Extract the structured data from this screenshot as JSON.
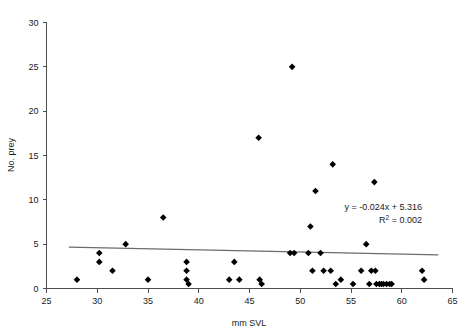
{
  "chart_data": {
    "type": "scatter",
    "title": "",
    "xlabel": "mm SVL",
    "ylabel": "No. prey",
    "xlim": [
      25,
      65
    ],
    "ylim": [
      0,
      30
    ],
    "xticks": [
      25,
      30,
      35,
      40,
      45,
      50,
      55,
      60,
      65
    ],
    "xtick_labels": [
      "25",
      "30",
      "35",
      "40",
      "45",
      "50",
      "55",
      "60",
      "65"
    ],
    "yticks": [
      0,
      5,
      10,
      15,
      20,
      25,
      30
    ],
    "ytick_labels": [
      "0",
      "5",
      "10",
      "15",
      "20",
      "25",
      "30"
    ],
    "grid": false,
    "legend": null,
    "marker": "diamond",
    "marker_color": "#000000",
    "points": [
      [
        28.0,
        1
      ],
      [
        30.2,
        4
      ],
      [
        30.2,
        3
      ],
      [
        31.5,
        2
      ],
      [
        32.8,
        5
      ],
      [
        35.0,
        1
      ],
      [
        36.5,
        8
      ],
      [
        38.8,
        3
      ],
      [
        38.8,
        2
      ],
      [
        38.8,
        1
      ],
      [
        39.0,
        0.5
      ],
      [
        43.0,
        1
      ],
      [
        43.5,
        3
      ],
      [
        44.0,
        1
      ],
      [
        45.9,
        17
      ],
      [
        46.0,
        1
      ],
      [
        46.2,
        0.5
      ],
      [
        49.2,
        25
      ],
      [
        49.0,
        4
      ],
      [
        49.4,
        4
      ],
      [
        50.8,
        4
      ],
      [
        51.0,
        7
      ],
      [
        51.2,
        2
      ],
      [
        51.5,
        11
      ],
      [
        52.0,
        4
      ],
      [
        52.3,
        2
      ],
      [
        53.0,
        2
      ],
      [
        53.2,
        14
      ],
      [
        53.5,
        0.5
      ],
      [
        54.0,
        1
      ],
      [
        55.2,
        0.5
      ],
      [
        56.0,
        2
      ],
      [
        56.5,
        5
      ],
      [
        56.8,
        0.5
      ],
      [
        57.0,
        2
      ],
      [
        57.3,
        12
      ],
      [
        57.4,
        2
      ],
      [
        57.5,
        0.5
      ],
      [
        57.8,
        0.5
      ],
      [
        58.0,
        0.5
      ],
      [
        58.2,
        0.5
      ],
      [
        58.5,
        0.5
      ],
      [
        58.8,
        0.5
      ],
      [
        59.0,
        0.5
      ],
      [
        62.0,
        2
      ],
      [
        62.2,
        1
      ]
    ],
    "trendline": {
      "slope": -0.024,
      "intercept": 5.316,
      "x_start": 27.2,
      "x_end": 63.6,
      "color": "#6b6b6b"
    },
    "annotations": {
      "equation": "y = -0.024x + 5.316",
      "r_squared_prefix": "R",
      "r_squared_exponent": "2",
      "r_squared_value": " = 0.002"
    }
  }
}
